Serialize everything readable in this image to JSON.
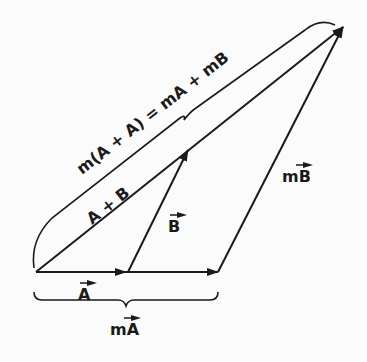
{
  "diagram": {
    "type": "vector-scalar-multiplication",
    "labels": {
      "vector_a": "A",
      "vector_b": "B",
      "sum_ab": "A + B",
      "m_a": "mA",
      "m_b": "mB",
      "m_sum": "m(A + A) = mA + mB"
    },
    "colors": {
      "ink": "#1a1a1a",
      "background": "#fbfbfb"
    }
  }
}
